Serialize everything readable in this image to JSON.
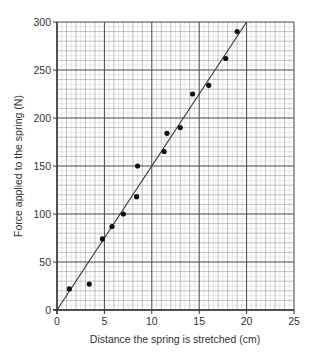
{
  "chart_data": {
    "type": "scatter",
    "title": "",
    "xlabel": "Distance the spring is stretched (cm)",
    "ylabel": "Force applied to the spring (N)",
    "xlim": [
      0,
      25
    ],
    "ylim": [
      0,
      300
    ],
    "xticks": [
      0,
      5,
      10,
      15,
      20,
      25
    ],
    "yticks": [
      0,
      50,
      100,
      150,
      200,
      250,
      300
    ],
    "grid": true,
    "legend": null,
    "series": [
      {
        "name": "measurements",
        "type": "scatter",
        "points": [
          {
            "x": 1.3,
            "y": 22
          },
          {
            "x": 3.4,
            "y": 27
          },
          {
            "x": 4.8,
            "y": 74
          },
          {
            "x": 5.8,
            "y": 87
          },
          {
            "x": 7.0,
            "y": 100
          },
          {
            "x": 8.4,
            "y": 118
          },
          {
            "x": 8.5,
            "y": 150
          },
          {
            "x": 11.3,
            "y": 165
          },
          {
            "x": 11.6,
            "y": 184
          },
          {
            "x": 13.0,
            "y": 190
          },
          {
            "x": 14.3,
            "y": 225
          },
          {
            "x": 16.0,
            "y": 234
          },
          {
            "x": 17.8,
            "y": 262
          },
          {
            "x": 19.0,
            "y": 290
          }
        ]
      },
      {
        "name": "line of best fit",
        "type": "line",
        "points": [
          {
            "x": 0,
            "y": 0
          },
          {
            "x": 20,
            "y": 300
          }
        ]
      }
    ]
  },
  "colors": {
    "axis": "#333333",
    "major_grid": "#444444",
    "minor_grid": "#9a9a9a",
    "fine_grid": "#d0d0d0",
    "points": "#111111",
    "fit_line": "#333333"
  }
}
